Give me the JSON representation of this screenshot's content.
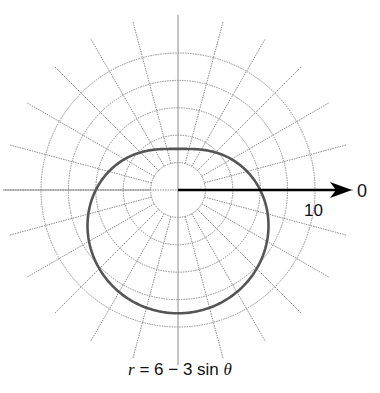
{
  "chart_data": {
    "type": "polar-line",
    "title": "",
    "equation": "r = 6 - 3 sin θ",
    "caption": {
      "r": "r",
      "rest": " = 6 − 3 sin ",
      "theta": "θ"
    },
    "axis_label_zero": "0",
    "radial_tick_label": "10",
    "radial_grid": [
      2,
      4,
      6,
      8,
      10
    ],
    "angular_grid_step_deg": 15,
    "rlim": [
      0,
      10
    ],
    "grid": true,
    "series": [
      {
        "name": "r = 6 - 3 sin θ",
        "a": 6,
        "b": -3,
        "function": "sin",
        "sample_points": [
          {
            "theta_deg": 0,
            "r": 6
          },
          {
            "theta_deg": 90,
            "r": 3
          },
          {
            "theta_deg": 180,
            "r": 6
          },
          {
            "theta_deg": 270,
            "r": 9
          }
        ]
      }
    ]
  },
  "colors": {
    "grid": "#8c8c8c",
    "curve": "#555555",
    "axis": "#000000",
    "text": "#111111"
  }
}
